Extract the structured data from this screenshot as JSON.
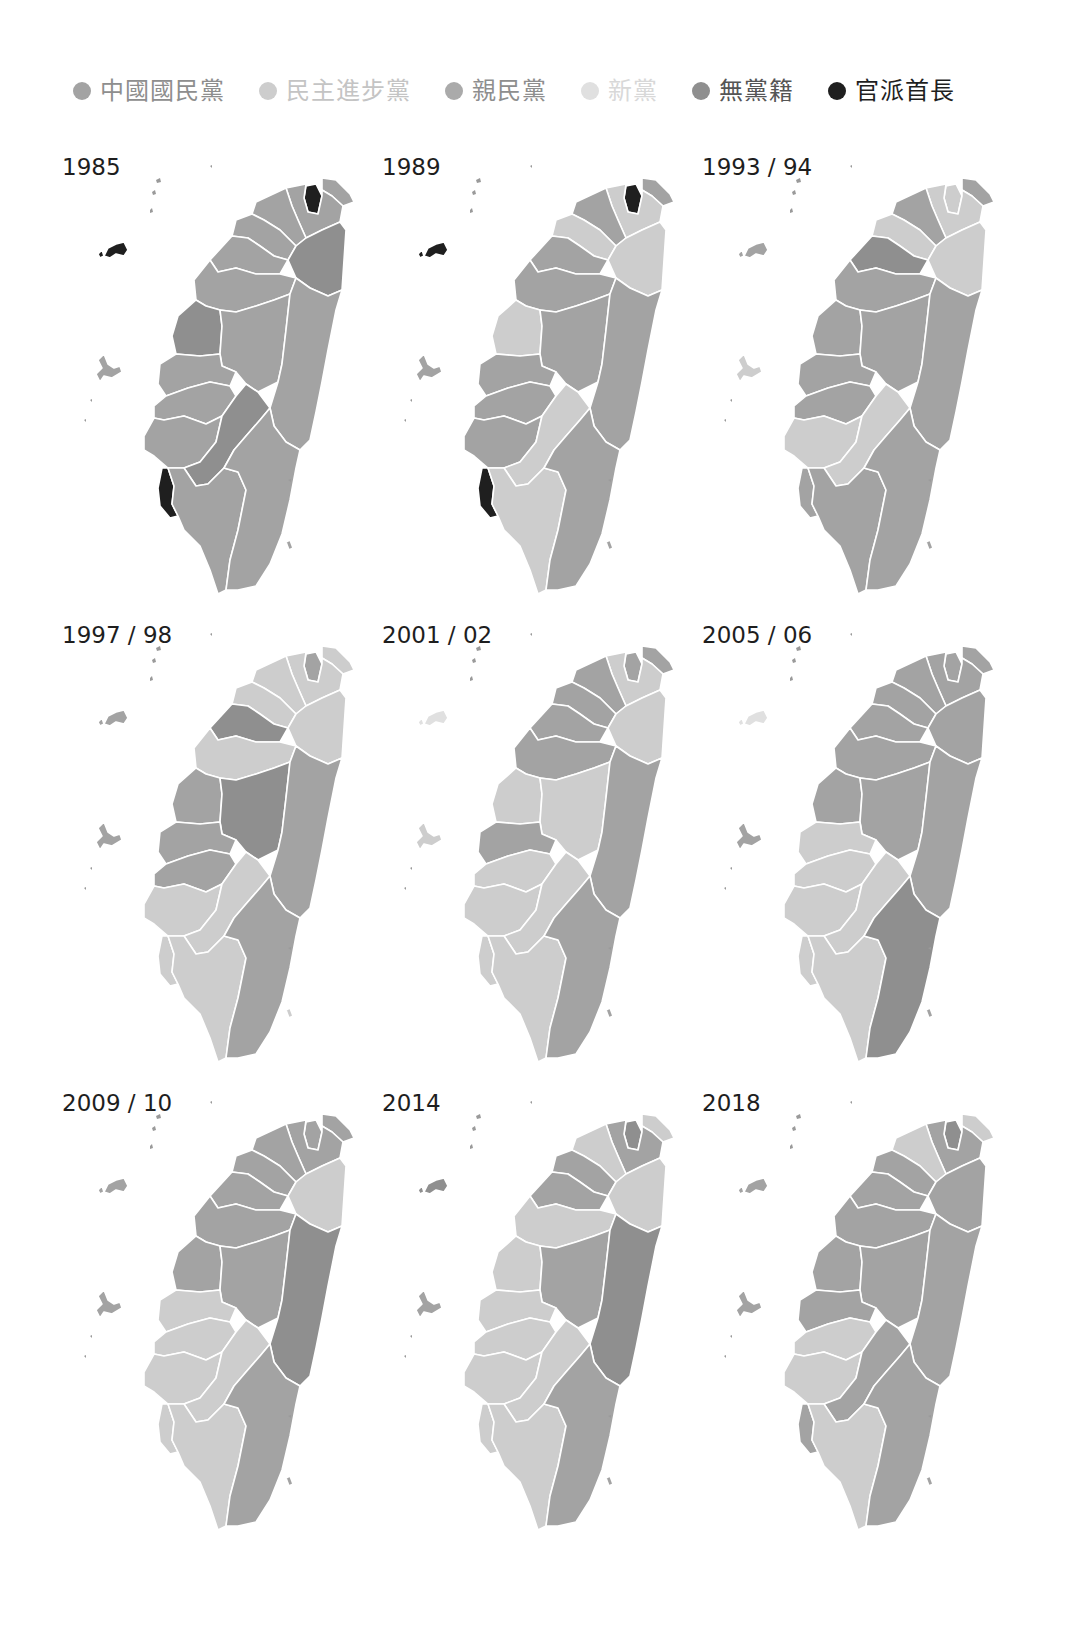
{
  "legend": [
    {
      "key": "kmt",
      "label": "中國國民黨",
      "color": "#a3a3a3",
      "text_color": "#8e8e8e"
    },
    {
      "key": "dpp",
      "label": "民主進步黨",
      "color": "#cdcdcd",
      "text_color": "#c4c4c4"
    },
    {
      "key": "pfp",
      "label": "親民黨",
      "color": "#aaaaaa",
      "text_color": "#8e8e8e"
    },
    {
      "key": "np",
      "label": "新黨",
      "color": "#e0e0e0",
      "text_color": "#d8d8d8"
    },
    {
      "key": "ind",
      "label": "無黨籍",
      "color": "#8f8f8f",
      "text_color": "#555555"
    },
    {
      "key": "appt",
      "label": "官派首長",
      "color": "#1f1f1f",
      "text_color": "#1f1f1f"
    }
  ],
  "chart_data": {
    "type": "choropleth",
    "title": "",
    "legend_position": "top",
    "categories": [
      "中國國民黨",
      "民主進步黨",
      "親民黨",
      "新黨",
      "無黨籍",
      "官派首長"
    ],
    "panels": [
      {
        "label": "1985",
        "fills": {
          "taipei": "appt",
          "keelung": "kmt",
          "newtaipei": "kmt",
          "taoyuan": "kmt",
          "hsinchu": "kmt",
          "miaoli": "kmt",
          "yilan": "ind",
          "taichung": "kmt",
          "changhua": "ind",
          "nantou": "kmt",
          "hualien": "kmt",
          "yunlin": "kmt",
          "chiayi": "kmt",
          "tainan": "kmt",
          "kaohsiung_county": "ind",
          "kaohsiung_city": "appt",
          "pingtung": "kmt",
          "taitung": "kmt",
          "penghu": "kmt",
          "kinmen": "appt",
          "lanyu": "kmt"
        }
      },
      {
        "label": "1989",
        "fills": {
          "taipei": "appt",
          "keelung": "kmt",
          "newtaipei": "dpp",
          "taoyuan": "kmt",
          "hsinchu": "dpp",
          "miaoli": "kmt",
          "yilan": "dpp",
          "taichung": "kmt",
          "changhua": "dpp",
          "nantou": "kmt",
          "hualien": "kmt",
          "yunlin": "kmt",
          "chiayi": "kmt",
          "tainan": "kmt",
          "kaohsiung_county": "dpp",
          "kaohsiung_city": "appt",
          "pingtung": "dpp",
          "taitung": "kmt",
          "penghu": "kmt",
          "kinmen": "appt",
          "lanyu": "kmt"
        }
      },
      {
        "label": "1993 / 94",
        "fills": {
          "taipei": "dpp",
          "keelung": "kmt",
          "newtaipei": "dpp",
          "taoyuan": "kmt",
          "hsinchu": "dpp",
          "miaoli": "ind",
          "yilan": "dpp",
          "taichung": "kmt",
          "changhua": "kmt",
          "nantou": "kmt",
          "hualien": "kmt",
          "yunlin": "kmt",
          "chiayi": "kmt",
          "tainan": "dpp",
          "kaohsiung_county": "dpp",
          "kaohsiung_city": "kmt",
          "pingtung": "kmt",
          "taitung": "kmt",
          "penghu": "dpp",
          "kinmen": "kmt",
          "lanyu": "kmt"
        }
      },
      {
        "label": "1997 / 98",
        "fills": {
          "taipei": "kmt",
          "keelung": "dpp",
          "newtaipei": "dpp",
          "taoyuan": "dpp",
          "hsinchu": "dpp",
          "miaoli": "ind",
          "yilan": "dpp",
          "taichung": "dpp",
          "changhua": "kmt",
          "nantou": "ind",
          "hualien": "kmt",
          "yunlin": "kmt",
          "chiayi": "kmt",
          "tainan": "dpp",
          "kaohsiung_county": "dpp",
          "kaohsiung_city": "dpp",
          "pingtung": "dpp",
          "taitung": "kmt",
          "penghu": "kmt",
          "kinmen": "kmt",
          "lanyu": "dpp"
        }
      },
      {
        "label": "2001 / 02",
        "fills": {
          "taipei": "kmt",
          "keelung": "kmt",
          "newtaipei": "dpp",
          "taoyuan": "kmt",
          "hsinchu": "kmt",
          "miaoli": "kmt",
          "yilan": "dpp",
          "taichung": "kmt",
          "changhua": "dpp",
          "nantou": "dpp",
          "hualien": "kmt",
          "yunlin": "kmt",
          "chiayi": "dpp",
          "tainan": "dpp",
          "kaohsiung_county": "dpp",
          "kaohsiung_city": "dpp",
          "pingtung": "dpp",
          "taitung": "kmt",
          "penghu": "dpp",
          "kinmen": "np",
          "lanyu": "kmt"
        }
      },
      {
        "label": "2005 / 06",
        "fills": {
          "taipei": "kmt",
          "keelung": "kmt",
          "newtaipei": "kmt",
          "taoyuan": "kmt",
          "hsinchu": "kmt",
          "miaoli": "kmt",
          "yilan": "kmt",
          "taichung": "kmt",
          "changhua": "kmt",
          "nantou": "kmt",
          "hualien": "kmt",
          "yunlin": "dpp",
          "chiayi": "dpp",
          "tainan": "dpp",
          "kaohsiung_county": "dpp",
          "kaohsiung_city": "dpp",
          "pingtung": "dpp",
          "taitung": "ind",
          "penghu": "kmt",
          "kinmen": "np",
          "lanyu": "kmt"
        }
      },
      {
        "label": "2009 / 10",
        "fills": {
          "taipei": "kmt",
          "keelung": "kmt",
          "newtaipei": "kmt",
          "taoyuan": "kmt",
          "hsinchu": "kmt",
          "miaoli": "kmt",
          "yilan": "dpp",
          "taichung": "kmt",
          "changhua": "kmt",
          "nantou": "kmt",
          "hualien": "ind",
          "yunlin": "dpp",
          "chiayi": "dpp",
          "tainan": "dpp",
          "kaohsiung_county": "dpp",
          "kaohsiung_city": "dpp",
          "pingtung": "dpp",
          "taitung": "kmt",
          "penghu": "kmt",
          "kinmen": "kmt",
          "lanyu": "kmt"
        }
      },
      {
        "label": "2014",
        "fills": {
          "taipei": "ind",
          "keelung": "dpp",
          "newtaipei": "kmt",
          "taoyuan": "dpp",
          "hsinchu": "kmt",
          "miaoli": "kmt",
          "yilan": "dpp",
          "taichung": "dpp",
          "changhua": "dpp",
          "nantou": "kmt",
          "hualien": "ind",
          "yunlin": "dpp",
          "chiayi": "dpp",
          "tainan": "dpp",
          "kaohsiung_county": "dpp",
          "kaohsiung_city": "dpp",
          "pingtung": "dpp",
          "taitung": "kmt",
          "penghu": "kmt",
          "kinmen": "ind",
          "lanyu": "kmt"
        }
      },
      {
        "label": "2018",
        "fills": {
          "taipei": "ind",
          "keelung": "dpp",
          "newtaipei": "kmt",
          "taoyuan": "dpp",
          "hsinchu": "kmt",
          "miaoli": "kmt",
          "yilan": "kmt",
          "taichung": "kmt",
          "changhua": "kmt",
          "nantou": "kmt",
          "hualien": "kmt",
          "yunlin": "kmt",
          "chiayi": "dpp",
          "tainan": "dpp",
          "kaohsiung_county": "kmt",
          "kaohsiung_city": "kmt",
          "pingtung": "dpp",
          "taitung": "kmt",
          "penghu": "kmt",
          "kinmen": "kmt",
          "lanyu": "kmt"
        }
      }
    ]
  }
}
